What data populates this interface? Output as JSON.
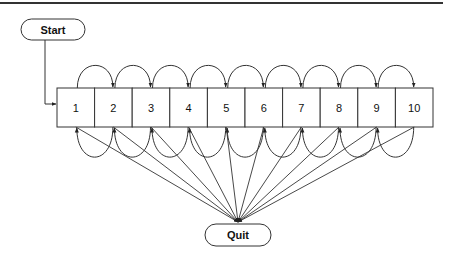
{
  "diagram": {
    "type": "state-transition",
    "top_rule": {
      "color": "#333333"
    },
    "start": {
      "label": "Start"
    },
    "quit": {
      "label": "Quit"
    },
    "states": [
      "1",
      "2",
      "3",
      "4",
      "5",
      "6",
      "7",
      "8",
      "9",
      "10"
    ],
    "edges": {
      "start_to": "1",
      "forward_arcs": "each state i -> i+1 (above row)",
      "backward_arcs": "each state i+1 -> i (below row)",
      "all_to_quit": true
    },
    "colors": {
      "stroke": "#333333",
      "fill": "#ffffff",
      "text": "#111111"
    }
  }
}
